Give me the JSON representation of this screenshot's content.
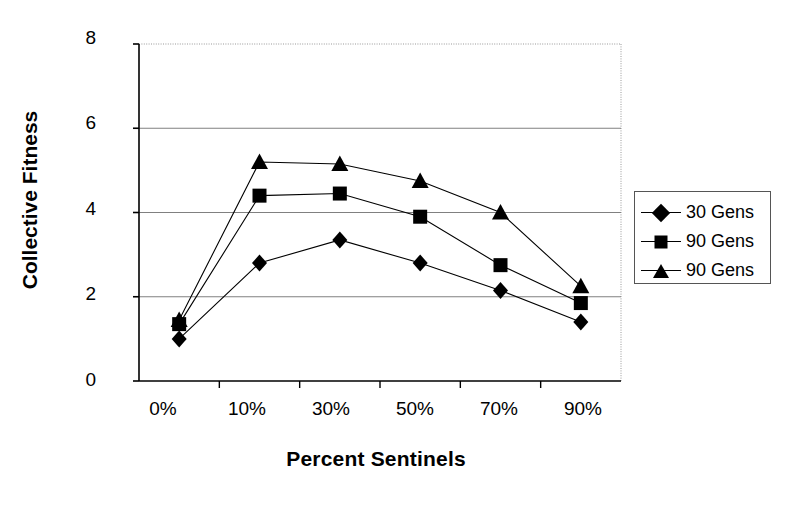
{
  "chart_data": {
    "type": "line",
    "title": "",
    "xlabel": "Percent Sentinels",
    "ylabel": "Collective Fitness",
    "categories": [
      "0%",
      "10%",
      "30%",
      "50%",
      "70%",
      "90%"
    ],
    "ylim": [
      0,
      8
    ],
    "yticks": [
      0,
      2,
      4,
      6,
      8
    ],
    "grid": "horizontal",
    "legend_position": "right",
    "series": [
      {
        "name": "30 Gens",
        "marker": "diamond-marker",
        "values": [
          1.0,
          2.8,
          3.35,
          2.8,
          2.15,
          1.4
        ]
      },
      {
        "name": "90 Gens",
        "marker": "square-marker",
        "values": [
          1.35,
          4.4,
          4.45,
          3.9,
          2.75,
          1.85
        ]
      },
      {
        "name": "90 Gens",
        "marker": "triangle-marker",
        "values": [
          1.45,
          5.2,
          5.15,
          4.75,
          4.0,
          2.25
        ]
      }
    ],
    "colors": {
      "series": "#000000",
      "grid": "#808080",
      "axis": "#000000",
      "background": "#ffffff"
    }
  },
  "axes": {
    "y_tick_labels": [
      "8",
      "6",
      "4",
      "2",
      "0"
    ],
    "x_tick_labels": [
      "0%",
      "10%",
      "30%",
      "50%",
      "70%",
      "90%"
    ],
    "y_title": "Collective Fitness",
    "x_title": "Percent Sentinels"
  },
  "legend": {
    "entries": [
      {
        "label": "30 Gens",
        "marker": "diamond-marker"
      },
      {
        "label": "90 Gens",
        "marker": "square-marker"
      },
      {
        "label": "90 Gens",
        "marker": "triangle-marker"
      }
    ]
  }
}
